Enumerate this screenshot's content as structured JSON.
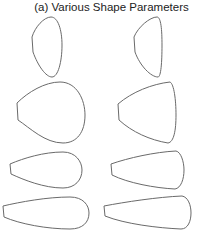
{
  "figure": {
    "title": "(a) Various Shape Parameters",
    "layout": {
      "rows": 4,
      "columns": 2
    },
    "stroke_color": "#6a6a6a",
    "shapes": [
      {
        "id": "r1c1",
        "description": "tall rounded drop, blunt left side"
      },
      {
        "id": "r1c2",
        "description": "tall drop, straighter right side"
      },
      {
        "id": "r2c1",
        "description": "wide rounded egg/teardrop"
      },
      {
        "id": "r2c2",
        "description": "wide fan-like teardrop, sharper corners"
      },
      {
        "id": "r3c1",
        "description": "horizontal rounded teardrop"
      },
      {
        "id": "r3c2",
        "description": "horizontal tapered teardrop"
      },
      {
        "id": "r4c1",
        "description": "long slender horizontal teardrop"
      },
      {
        "id": "r4c2",
        "description": "long slender tapered teardrop"
      }
    ]
  }
}
